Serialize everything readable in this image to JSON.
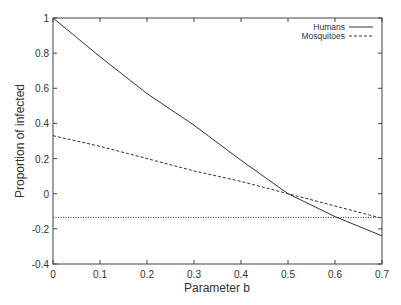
{
  "chart_data": {
    "type": "line",
    "title": "",
    "xlabel": "Parameter b",
    "ylabel": "Proportion of infected",
    "xlim": [
      0,
      0.7
    ],
    "ylim": [
      -0.4,
      1
    ],
    "x_ticks": [
      "0",
      "0.1",
      "0.2",
      "0.3",
      "0.4",
      "0.5",
      "0.6",
      "0.7"
    ],
    "y_ticks": [
      "-0.4",
      "-0.2",
      "0",
      "0.2",
      "0.4",
      "0.6",
      "0.8",
      "1"
    ],
    "grid": false,
    "legend_position": "top-right",
    "x": [
      0,
      0.1,
      0.2,
      0.3,
      0.4,
      0.5,
      0.6,
      0.7
    ],
    "series": [
      {
        "name": "Humans",
        "style": "solid",
        "values": [
          1.0,
          0.78,
          0.57,
          0.39,
          0.19,
          0.0,
          -0.13,
          -0.24
        ]
      },
      {
        "name": "Mosquitoes",
        "style": "dashed",
        "values": [
          0.33,
          0.27,
          0.2,
          0.13,
          0.07,
          0.0,
          -0.07,
          -0.14
        ]
      },
      {
        "name": "",
        "style": "dotted",
        "values": [
          -0.135,
          -0.135,
          -0.135,
          -0.135,
          -0.135,
          -0.135,
          -0.135,
          -0.135
        ]
      }
    ]
  }
}
